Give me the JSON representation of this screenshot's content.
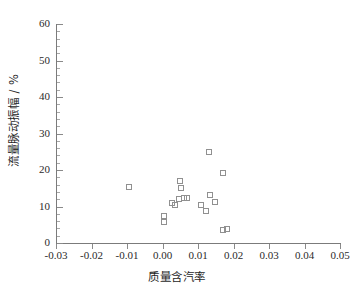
{
  "chart_data": {
    "type": "scatter",
    "title": "",
    "xlabel": "质量含汽率",
    "ylabel": "流量脉动振幅 / %",
    "xlim": [
      -0.03,
      0.05
    ],
    "ylim": [
      0,
      60
    ],
    "xticks": [
      -0.03,
      -0.02,
      -0.01,
      0.0,
      0.01,
      0.02,
      0.03,
      0.04,
      0.05
    ],
    "xtick_labels": [
      "-0.03",
      "-0.02",
      "-0.01",
      "0.00",
      "0.01",
      "0.02",
      "0.03",
      "0.04",
      "0.05"
    ],
    "yticks": [
      0,
      10,
      20,
      30,
      40,
      50,
      60
    ],
    "ytick_labels": [
      "0",
      "10",
      "20",
      "30",
      "40",
      "50",
      "60"
    ],
    "y_minor_tick_step": 2,
    "grid": false,
    "legend": null,
    "marker": "open-square",
    "marker_color": "#909090",
    "axis_color": "#7b7b7b",
    "series": [
      {
        "name": "流量脉动振幅",
        "points": [
          {
            "x": -0.0097,
            "y": 15.5
          },
          {
            "x": 0.0003,
            "y": 7.6
          },
          {
            "x": 0.0003,
            "y": 6.0
          },
          {
            "x": 0.0026,
            "y": 11.0
          },
          {
            "x": 0.0034,
            "y": 10.6
          },
          {
            "x": 0.0046,
            "y": 12.2
          },
          {
            "x": 0.0048,
            "y": 17.1
          },
          {
            "x": 0.0052,
            "y": 15.1
          },
          {
            "x": 0.0058,
            "y": 12.4
          },
          {
            "x": 0.0069,
            "y": 12.5
          },
          {
            "x": 0.0106,
            "y": 10.6
          },
          {
            "x": 0.012,
            "y": 8.8
          },
          {
            "x": 0.013,
            "y": 25.0
          },
          {
            "x": 0.0133,
            "y": 13.3
          },
          {
            "x": 0.0146,
            "y": 11.4
          },
          {
            "x": 0.0168,
            "y": 19.2
          },
          {
            "x": 0.0168,
            "y": 3.6
          },
          {
            "x": 0.018,
            "y": 4.0
          }
        ]
      }
    ]
  },
  "figure": {
    "background_color": "#ffffff",
    "plot_left_value": -0.03,
    "plot_right_value": 0.05,
    "plot_bottom_value": 0,
    "plot_top_value": 60
  }
}
